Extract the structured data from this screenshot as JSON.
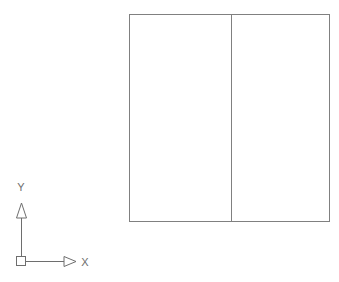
{
  "viewport": {
    "name": "cad-drawing-viewport",
    "background_color": "#ffffff",
    "width": 339,
    "height": 282
  },
  "drawing": {
    "line_color": "#808080",
    "line_width": 1,
    "outer_rectangle": {
      "label": "outer-rectangle",
      "x": 129,
      "y": 14,
      "width": 201,
      "height": 208
    },
    "divider_line": {
      "label": "vertical-divider",
      "x": 231,
      "y1": 14,
      "y2": 222
    },
    "panels": [
      {
        "label": "left-panel",
        "x": 129,
        "y": 14,
        "width": 102,
        "height": 208
      },
      {
        "label": "right-panel",
        "x": 231,
        "y": 14,
        "width": 99,
        "height": 208
      }
    ]
  },
  "ucs_icon": {
    "name": "ucs-coordinate-icon",
    "color": "#6e6e6e",
    "origin": {
      "x": 21,
      "y": 261
    },
    "origin_square_size": 9,
    "x_axis": {
      "label": "X",
      "label_x": 85,
      "label_y": 266,
      "line_start_x": 25,
      "line_end_x": 64,
      "arrow_tip_x": 76,
      "arrow_half_height": 5
    },
    "y_axis": {
      "label": "Y",
      "label_x": 20,
      "label_y": 190,
      "line_start_y": 257,
      "line_end_y": 217,
      "arrow_tip_y": 203,
      "arrow_half_width": 5
    }
  }
}
